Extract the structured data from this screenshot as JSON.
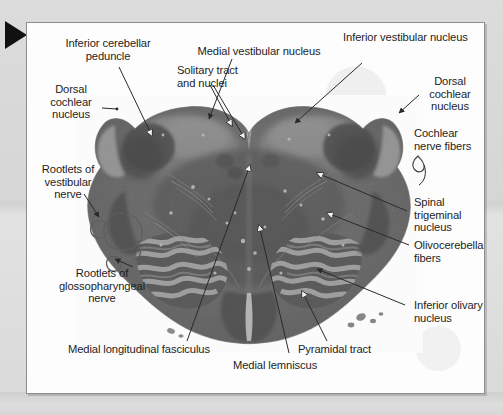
{
  "figure": {
    "kind": "photomicrograph",
    "marker_icon": "black-right-triangle-marker",
    "panel_background": "#fdfdfd",
    "page_background": "#d9d9d9",
    "text_color": "#1d1d1d"
  },
  "labels": {
    "inferior_cerebellar_peduncle": "Inferior cerebellar\npeduncle",
    "dorsal_cochlear_nucleus_left": "Dorsal\ncochlear\nnucleus",
    "rootlets_of_vestibular_nerve": "Rootlets of\nvestibular\nnerve",
    "rootlets_of_glossopharyngeal_nerve": "Rootlets of\nglossopharyngeal\nnerve",
    "medial_vestibular_nucleus": "Medial vestibular nucleus",
    "solitary_tract_and_nuclei": "Solitary tract\nand nuclei",
    "inferior_vestibular_nucleus": "Inferior vestibular nucleus",
    "dorsal_cochlear_nucleus_right": "Dorsal\ncochlear\nnucleus",
    "cochlear_nerve_fibers": "Cochlear\nnerve fibers",
    "spinal_trigeminal_nucleus": "Spinal\ntrigeminal\nnucleus",
    "olivocerebellar_fibers": "Olivocerebellar\nfibers",
    "inferior_olivary_nucleus": "Inferior olivary\nnucleus",
    "medial_longitudinal_fasciculus": "Medial longitudinal fasciculus",
    "medial_lemniscus": "Medial lemniscus",
    "pyramidal_tract": "Pyramidal tract"
  }
}
